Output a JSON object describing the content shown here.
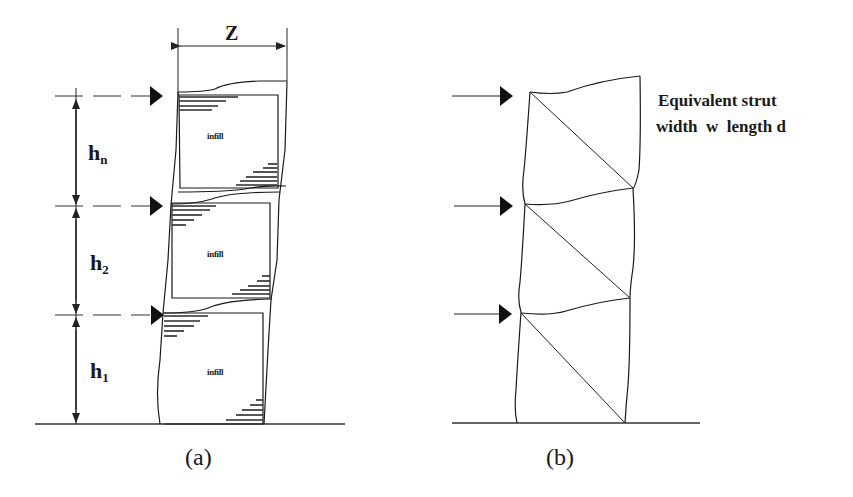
{
  "panel_a": {
    "caption": "(a)",
    "dimension_width_label": "Z",
    "storey_labels": [
      {
        "main": "h",
        "sub": "n"
      },
      {
        "main": "h",
        "sub": "2"
      },
      {
        "main": "h",
        "sub": "1"
      }
    ],
    "infill_labels": [
      "infill",
      "infill",
      "infill"
    ],
    "lateral_loads": 3
  },
  "panel_b": {
    "caption": "(b)",
    "note_line1": "Equivalent strut",
    "note_line2": "width  w  length d",
    "lateral_loads": 3
  }
}
